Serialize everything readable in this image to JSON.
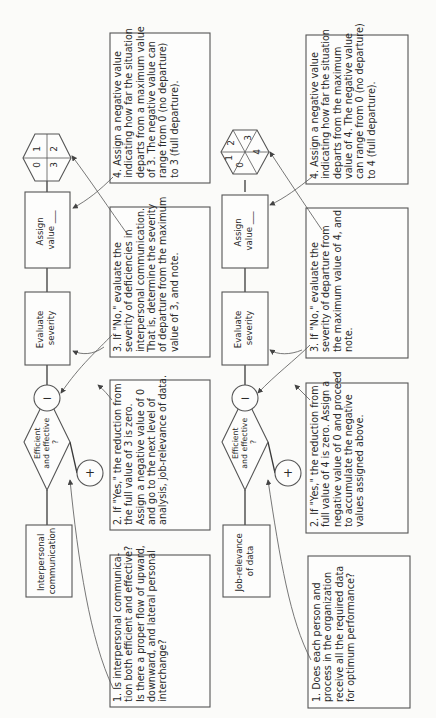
{
  "rows": [
    {
      "topic": [
        "Interpersonal",
        "communication"
      ],
      "decision": [
        "Efficient",
        "and effective",
        "?"
      ],
      "minus_symbol": "−",
      "plus_symbol": "+",
      "evaluate": [
        "Evaluate",
        "severity"
      ],
      "assign": [
        "Assign",
        "value ___"
      ],
      "hexagon_values": [
        "0",
        "1",
        "2",
        "3"
      ],
      "notes": {
        "n1": [
          "1. Is interpersonal communica-",
          "tion both efficient and effective?",
          "Is there a proper flow of upward,",
          "downward, and lateral personal",
          "interchange?"
        ],
        "n2": [
          "2. If \"Yes,\" the reduction from",
          "the full value of 3 is zero.",
          "Assign a negative value of 0",
          "and go to the next level of",
          "analysis, job-relevance of data."
        ],
        "n3": [
          "3. If \"No,\" evaluate the",
          "severity of deficiencies in",
          "interpersonal communication.",
          "That is, determine the severity",
          "of departure from the maximum",
          "value of 3, and note."
        ],
        "n4": [
          "4. Assign a negative value",
          "indicating how far the situation",
          "departs from a maximum value",
          "of 3. The negative value can",
          "range from 0 (no departure)",
          "to 3 (full departure)."
        ]
      }
    },
    {
      "topic": [
        "Job-relevance",
        "of data"
      ],
      "decision": [
        "Efficient",
        "and effective",
        "?"
      ],
      "minus_symbol": "−",
      "plus_symbol": "+",
      "evaluate": [
        "Evaluate",
        "severity"
      ],
      "assign": [
        "Assign",
        "value ___"
      ],
      "hexagon_values": [
        "0",
        "1",
        "2",
        "3",
        "4"
      ],
      "notes": {
        "n1": [
          "1. Does each person and",
          "process in the organization",
          "receive all the required data",
          "for optimum performance?"
        ],
        "n2": [
          "2. If \"Yes,\" the reduction from",
          "full value of 4 is zero. Assign a",
          "negative value of 0 and proceed",
          "to accumulate the negative",
          "values assigned above."
        ],
        "n3": [
          "3. If \"No,\" evaluate the",
          "severity of departure from",
          "the maximum value of 4, and",
          "note."
        ],
        "n4": [
          "4. Assign a negative value",
          "indicating how far the situation",
          "departs from the maximum",
          "value of 4. The negative value",
          "can range from 0 (no departure)",
          "to 4 (full departure)."
        ]
      }
    }
  ]
}
